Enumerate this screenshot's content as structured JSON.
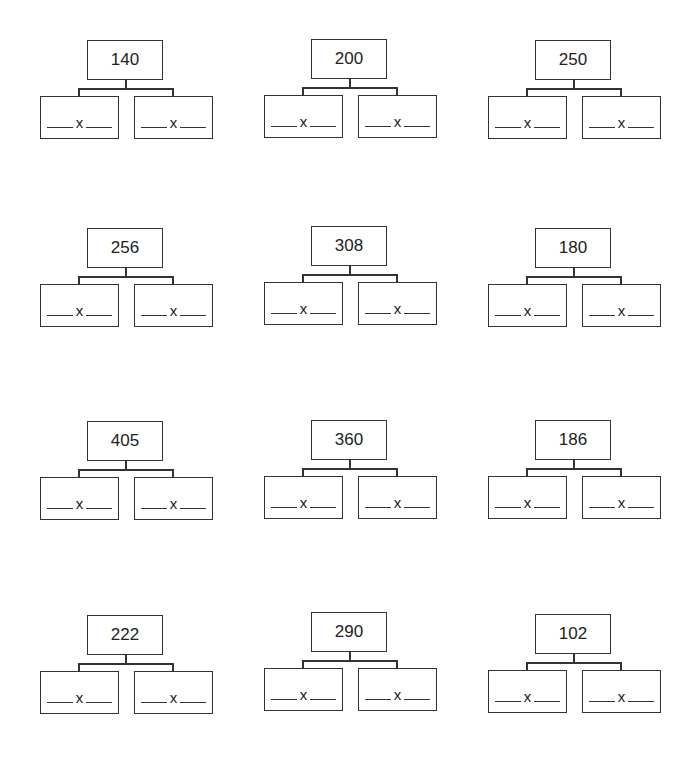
{
  "worksheet": {
    "times_symbol": "x",
    "trees": [
      {
        "number": "140"
      },
      {
        "number": "200"
      },
      {
        "number": "250"
      },
      {
        "number": "256"
      },
      {
        "number": "308"
      },
      {
        "number": "180"
      },
      {
        "number": "405"
      },
      {
        "number": "360"
      },
      {
        "number": "186"
      },
      {
        "number": "222"
      },
      {
        "number": "290"
      },
      {
        "number": "102"
      }
    ]
  }
}
